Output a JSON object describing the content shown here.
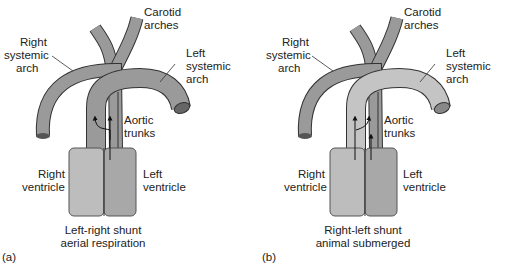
{
  "panels": [
    {
      "id": "a",
      "panel_label": "(a)",
      "labels": {
        "carotid": [
          "Carotid",
          "arches"
        ],
        "right_systemic": [
          "Right",
          "systemic",
          "arch"
        ],
        "left_systemic": [
          "Left",
          "systemic",
          "arch"
        ],
        "aortic": [
          "Aortic",
          "trunks"
        ],
        "right_ventricle": [
          "Right",
          "ventricle"
        ],
        "left_ventricle": [
          "Left",
          "ventricle"
        ],
        "caption": [
          "Left-right shunt",
          "aerial respiration"
        ]
      }
    },
    {
      "id": "b",
      "panel_label": "(b)",
      "labels": {
        "carotid": [
          "Carotid",
          "arches"
        ],
        "right_systemic": [
          "Right",
          "systemic",
          "arch"
        ],
        "left_systemic": [
          "Left",
          "systemic",
          "arch"
        ],
        "aortic": [
          "Aortic",
          "trunks"
        ],
        "right_ventricle": [
          "Right",
          "ventricle"
        ],
        "left_ventricle": [
          "Left",
          "ventricle"
        ],
        "caption": [
          "Right-left shunt",
          "animal submerged"
        ]
      }
    }
  ],
  "colors": {
    "vessel_dark": "#9a9a9a",
    "vessel_light": "#c4c4c4",
    "ventricle_right": "#bdbdbd",
    "ventricle_left": "#a8a8a8",
    "outline": "#333333"
  }
}
